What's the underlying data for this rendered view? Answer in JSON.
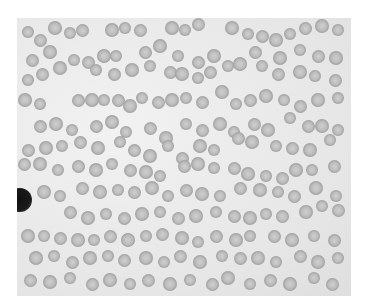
{
  "image": {
    "description": "Grayscale light micrograph of a blood smear showing red blood cells, many in rouleaux chains, with one dark-staining white blood cell at the left edge",
    "frame": {
      "x": 17,
      "y": 18,
      "width": 334,
      "height": 278
    },
    "cell_diameter": 13,
    "cells": [
      [
        28,
        32
      ],
      [
        40,
        40
      ],
      [
        55,
        28
      ],
      [
        70,
        33
      ],
      [
        82,
        30
      ],
      [
        112,
        30
      ],
      [
        125,
        28
      ],
      [
        140,
        30
      ],
      [
        172,
        28
      ],
      [
        185,
        30
      ],
      [
        198,
        24
      ],
      [
        232,
        28
      ],
      [
        248,
        34
      ],
      [
        262,
        36
      ],
      [
        276,
        40
      ],
      [
        290,
        34
      ],
      [
        305,
        28
      ],
      [
        322,
        26
      ],
      [
        338,
        30
      ],
      [
        32,
        60
      ],
      [
        50,
        52
      ],
      [
        74,
        60
      ],
      [
        88,
        62
      ],
      [
        104,
        56
      ],
      [
        116,
        56
      ],
      [
        145,
        52
      ],
      [
        160,
        46
      ],
      [
        178,
        56
      ],
      [
        198,
        62
      ],
      [
        214,
        56
      ],
      [
        228,
        66
      ],
      [
        255,
        52
      ],
      [
        280,
        58
      ],
      [
        300,
        50
      ],
      [
        318,
        56
      ],
      [
        336,
        58
      ],
      [
        28,
        80
      ],
      [
        42,
        74
      ],
      [
        60,
        68
      ],
      [
        96,
        70
      ],
      [
        114,
        74
      ],
      [
        132,
        70
      ],
      [
        150,
        66
      ],
      [
        170,
        72
      ],
      [
        182,
        74
      ],
      [
        198,
        78
      ],
      [
        210,
        72
      ],
      [
        240,
        64
      ],
      [
        262,
        66
      ],
      [
        278,
        74
      ],
      [
        300,
        72
      ],
      [
        315,
        76
      ],
      [
        335,
        80
      ],
      [
        25,
        100
      ],
      [
        40,
        104
      ],
      [
        78,
        100
      ],
      [
        92,
        100
      ],
      [
        104,
        100
      ],
      [
        118,
        100
      ],
      [
        130,
        106
      ],
      [
        142,
        98
      ],
      [
        158,
        102
      ],
      [
        172,
        100
      ],
      [
        186,
        98
      ],
      [
        202,
        102
      ],
      [
        222,
        92
      ],
      [
        236,
        104
      ],
      [
        250,
        100
      ],
      [
        266,
        96
      ],
      [
        284,
        100
      ],
      [
        300,
        106
      ],
      [
        318,
        100
      ],
      [
        338,
        98
      ],
      [
        40,
        126
      ],
      [
        56,
        124
      ],
      [
        72,
        130
      ],
      [
        96,
        126
      ],
      [
        112,
        122
      ],
      [
        126,
        132
      ],
      [
        150,
        128
      ],
      [
        166,
        138
      ],
      [
        186,
        124
      ],
      [
        202,
        130
      ],
      [
        220,
        124
      ],
      [
        234,
        132
      ],
      [
        254,
        124
      ],
      [
        268,
        130
      ],
      [
        290,
        118
      ],
      [
        308,
        126
      ],
      [
        322,
        126
      ],
      [
        338,
        130
      ],
      [
        28,
        150
      ],
      [
        46,
        148
      ],
      [
        62,
        146
      ],
      [
        80,
        142
      ],
      [
        98,
        148
      ],
      [
        120,
        142
      ],
      [
        134,
        150
      ],
      [
        150,
        156
      ],
      [
        168,
        146
      ],
      [
        182,
        158
      ],
      [
        200,
        146
      ],
      [
        214,
        150
      ],
      [
        238,
        138
      ],
      [
        252,
        142
      ],
      [
        276,
        146
      ],
      [
        292,
        148
      ],
      [
        310,
        150
      ],
      [
        330,
        140
      ],
      [
        24,
        164
      ],
      [
        40,
        164
      ],
      [
        58,
        170
      ],
      [
        78,
        166
      ],
      [
        96,
        170
      ],
      [
        112,
        164
      ],
      [
        130,
        170
      ],
      [
        146,
        172
      ],
      [
        160,
        176
      ],
      [
        184,
        166
      ],
      [
        198,
        164
      ],
      [
        214,
        168
      ],
      [
        234,
        168
      ],
      [
        248,
        174
      ],
      [
        266,
        176
      ],
      [
        282,
        178
      ],
      [
        296,
        170
      ],
      [
        312,
        170
      ],
      [
        334,
        166
      ],
      [
        44,
        192
      ],
      [
        60,
        196
      ],
      [
        82,
        188
      ],
      [
        100,
        192
      ],
      [
        118,
        190
      ],
      [
        134,
        192
      ],
      [
        152,
        188
      ],
      [
        168,
        196
      ],
      [
        186,
        190
      ],
      [
        202,
        194
      ],
      [
        220,
        196
      ],
      [
        240,
        188
      ],
      [
        260,
        190
      ],
      [
        278,
        192
      ],
      [
        294,
        196
      ],
      [
        316,
        188
      ],
      [
        336,
        196
      ],
      [
        70,
        212
      ],
      [
        88,
        218
      ],
      [
        106,
        214
      ],
      [
        124,
        218
      ],
      [
        142,
        214
      ],
      [
        160,
        212
      ],
      [
        178,
        218
      ],
      [
        196,
        216
      ],
      [
        216,
        212
      ],
      [
        234,
        216
      ],
      [
        250,
        218
      ],
      [
        266,
        214
      ],
      [
        282,
        216
      ],
      [
        306,
        212
      ],
      [
        322,
        206
      ],
      [
        338,
        210
      ],
      [
        28,
        236
      ],
      [
        44,
        236
      ],
      [
        60,
        238
      ],
      [
        78,
        240
      ],
      [
        94,
        240
      ],
      [
        110,
        236
      ],
      [
        128,
        240
      ],
      [
        146,
        236
      ],
      [
        162,
        234
      ],
      [
        182,
        238
      ],
      [
        198,
        242
      ],
      [
        216,
        236
      ],
      [
        236,
        240
      ],
      [
        250,
        236
      ],
      [
        274,
        236
      ],
      [
        292,
        240
      ],
      [
        314,
        236
      ],
      [
        334,
        240
      ],
      [
        36,
        258
      ],
      [
        54,
        256
      ],
      [
        72,
        262
      ],
      [
        90,
        258
      ],
      [
        108,
        256
      ],
      [
        124,
        260
      ],
      [
        146,
        258
      ],
      [
        164,
        262
      ],
      [
        180,
        256
      ],
      [
        200,
        262
      ],
      [
        222,
        256
      ],
      [
        240,
        258
      ],
      [
        258,
        258
      ],
      [
        276,
        262
      ],
      [
        300,
        256
      ],
      [
        318,
        262
      ],
      [
        338,
        258
      ],
      [
        30,
        280
      ],
      [
        50,
        282
      ],
      [
        70,
        278
      ],
      [
        92,
        284
      ],
      [
        110,
        280
      ],
      [
        130,
        284
      ],
      [
        148,
        280
      ],
      [
        170,
        284
      ],
      [
        190,
        280
      ],
      [
        212,
        284
      ],
      [
        228,
        278
      ],
      [
        250,
        284
      ],
      [
        270,
        280
      ],
      [
        290,
        284
      ],
      [
        314,
        278
      ],
      [
        332,
        284
      ]
    ],
    "leukocyte": {
      "x": 20,
      "y": 200,
      "diameter": 24
    }
  }
}
